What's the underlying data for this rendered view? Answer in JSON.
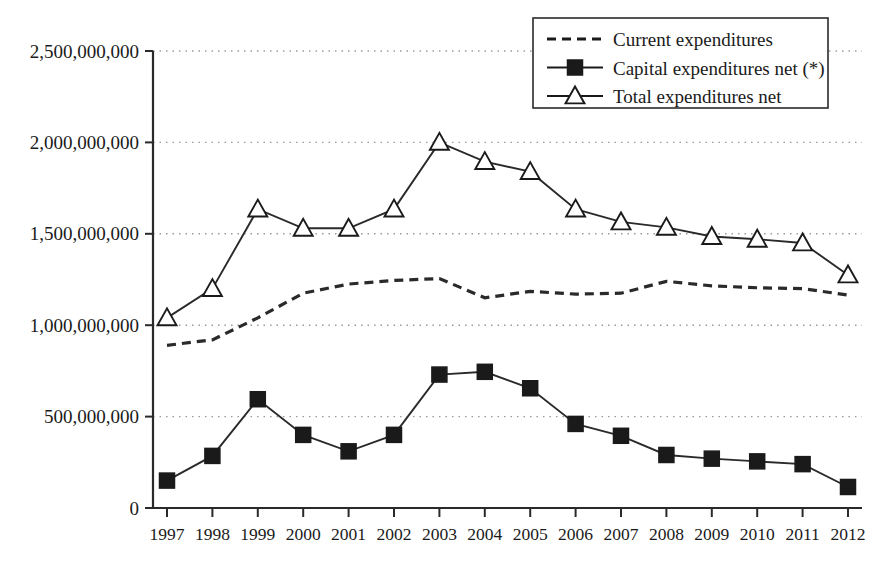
{
  "chart_data": {
    "type": "line",
    "title": "",
    "subtitle": "",
    "xlabel": "",
    "ylabel": "",
    "grid": true,
    "legend_position": "top-right",
    "xlim": [
      "1997",
      "2012"
    ],
    "ylim": [
      0,
      2500000000
    ],
    "ytick_step": 500000000,
    "categories": [
      "1997",
      "1998",
      "1999",
      "2000",
      "2001",
      "2002",
      "2003",
      "2004",
      "2005",
      "2006",
      "2007",
      "2008",
      "2009",
      "2010",
      "2011",
      "2012"
    ],
    "ytick_labels": [
      "2,500,000,000",
      "2,000,000,000",
      "1,500,000,000",
      "1,000,000,000",
      "500,000,000",
      "0"
    ],
    "ytick_values": [
      2500000000,
      2000000000,
      1500000000,
      1000000000,
      500000000,
      0
    ],
    "series": [
      {
        "name": "Current expenditures",
        "marker": "none",
        "style": "dashed",
        "values": [
          890000000,
          920000000,
          1040000000,
          1175000000,
          1225000000,
          1245000000,
          1255000000,
          1150000000,
          1185000000,
          1170000000,
          1175000000,
          1240000000,
          1215000000,
          1205000000,
          1200000000,
          1165000000
        ]
      },
      {
        "name": "Capital expenditures net (*)",
        "marker": "filled-square",
        "style": "solid",
        "values": [
          150000000,
          285000000,
          595000000,
          400000000,
          310000000,
          400000000,
          730000000,
          745000000,
          655000000,
          460000000,
          395000000,
          290000000,
          270000000,
          255000000,
          240000000,
          115000000
        ]
      },
      {
        "name": "Total expenditures net",
        "marker": "open-triangle",
        "style": "solid",
        "values": [
          1040000000,
          1200000000,
          1635000000,
          1530000000,
          1530000000,
          1635000000,
          2000000000,
          1895000000,
          1840000000,
          1635000000,
          1565000000,
          1535000000,
          1485000000,
          1470000000,
          1450000000,
          1275000000
        ]
      }
    ]
  },
  "legend": {
    "items": [
      {
        "label": "Current expenditures",
        "marker": "dashed-line"
      },
      {
        "label": "Capital expenditures net (*)",
        "marker": "filled-square"
      },
      {
        "label": "Total expenditures net",
        "marker": "open-triangle"
      }
    ]
  },
  "colors": {
    "ink": "#1a1a1a",
    "axis": "#2a2a2a",
    "grid": "#9a9a9a",
    "background": "#ffffff"
  }
}
